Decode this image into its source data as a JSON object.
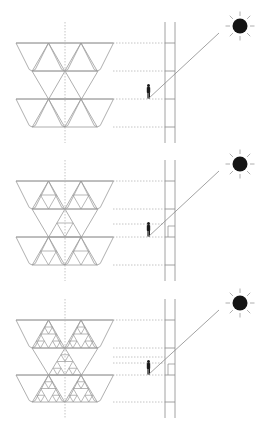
{
  "diagram": {
    "title": "",
    "colors": {
      "background": "#ffffff",
      "linework": "#9a9a9a",
      "guides": "#b5b5b5",
      "sun": "#151515",
      "figure": "#1a1a1a"
    },
    "panels": [
      {
        "id": "panel-1",
        "label": "",
        "fractal_iteration": 0,
        "y_offset": 0,
        "has_niche": false,
        "floor_guides": [
          43,
          71,
          99,
          127
        ],
        "extra_guides": []
      },
      {
        "id": "panel-2",
        "label": "",
        "fractal_iteration": 1,
        "y_offset": 145,
        "has_niche": true,
        "floor_guides": [
          36,
          64,
          92,
          120
        ],
        "extra_guides": [
          79
        ]
      },
      {
        "id": "panel-3",
        "label": "",
        "fractal_iteration": 2,
        "y_offset": 285,
        "has_niche": true,
        "floor_guides": [
          35,
          63,
          90,
          117
        ],
        "extra_guides": [
          72,
          78
        ]
      }
    ],
    "elements": {
      "sun_icon": "sun-icon",
      "person_icon": "person-silhouette-icon",
      "wall": "facade-wall-section",
      "ray": "sun-ray-line"
    }
  }
}
